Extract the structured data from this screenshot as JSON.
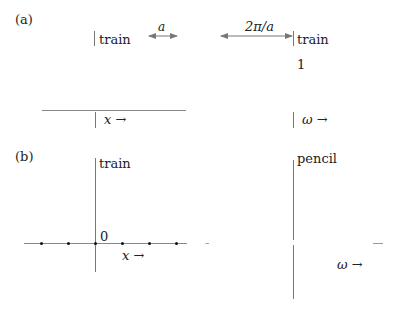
{
  "panel_a": {
    "label": "(a)",
    "left": {
      "top_label": "train",
      "spacing_label": "a",
      "axis_label": "x →"
    },
    "right": {
      "spacing_label": "2π/a",
      "top_label": "train",
      "value_label": "1",
      "axis_label": "ω →"
    }
  },
  "panel_b": {
    "label": "(b)",
    "left": {
      "top_label": "train",
      "origin_label": "0",
      "axis_label": "x →",
      "dot_count": 6
    },
    "right": {
      "top_label": "pencil",
      "left_dash": "-",
      "right_dash": "—",
      "axis_label": "ω →"
    }
  }
}
